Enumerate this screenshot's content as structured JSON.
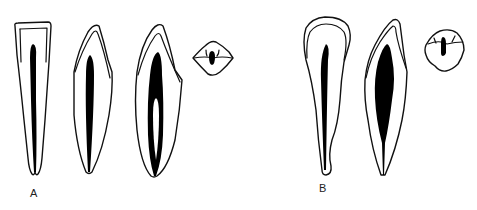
{
  "figure": {
    "groups": [
      {
        "label": "A",
        "views": [
          {
            "type": "longitudinal-section",
            "note": "single tapered canal, flat incisal edge"
          },
          {
            "type": "longitudinal-section",
            "note": "single fusiform canal"
          },
          {
            "type": "longitudinal-section",
            "note": "canal dividing into two and rejoining apically"
          },
          {
            "type": "cross-section",
            "note": "rhomboid cervical outline with central canal"
          }
        ]
      },
      {
        "label": "B",
        "views": [
          {
            "type": "longitudinal-section",
            "note": "single narrow canal, curved apex"
          },
          {
            "type": "longitudinal-section",
            "note": "single wide fusiform canal"
          },
          {
            "type": "cross-section",
            "note": "rounded cervical outline with central canal"
          }
        ]
      }
    ],
    "colors": {
      "line": "#111111",
      "pulp": "#000000",
      "background": "#ffffff"
    }
  }
}
